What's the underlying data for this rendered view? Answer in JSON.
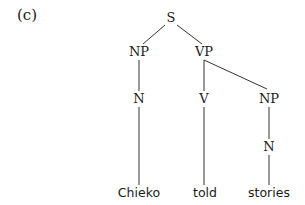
{
  "example_label": "(c)",
  "tree": {
    "nodes": [
      {
        "id": "S",
        "label": "S",
        "x": 171,
        "y": 22
      },
      {
        "id": "NP1",
        "label": "NP",
        "x": 139,
        "y": 56
      },
      {
        "id": "VP",
        "label": "VP",
        "x": 204,
        "y": 56
      },
      {
        "id": "N1",
        "label": "N",
        "x": 139,
        "y": 103
      },
      {
        "id": "V",
        "label": "V",
        "x": 204,
        "y": 103
      },
      {
        "id": "NP2",
        "label": "NP",
        "x": 269,
        "y": 103
      },
      {
        "id": "N2",
        "label": "N",
        "x": 269,
        "y": 151
      }
    ],
    "leaves": [
      {
        "id": "w1",
        "label": "Chieko",
        "x": 139,
        "y": 197
      },
      {
        "id": "w2",
        "label": "told",
        "x": 205,
        "y": 197
      },
      {
        "id": "w3",
        "label": "stories",
        "x": 269,
        "y": 197
      }
    ],
    "edges": [
      {
        "from": "S",
        "to": "NP1",
        "x1": 165,
        "y1": 25,
        "x2": 143,
        "y2": 44
      },
      {
        "from": "S",
        "to": "VP",
        "x1": 177,
        "y1": 25,
        "x2": 202,
        "y2": 44
      },
      {
        "from": "NP1",
        "to": "N1",
        "x1": 139,
        "y1": 60,
        "x2": 139,
        "y2": 91
      },
      {
        "from": "VP",
        "to": "V",
        "x1": 204,
        "y1": 60,
        "x2": 204,
        "y2": 91
      },
      {
        "from": "VP",
        "to": "NP2",
        "x1": 204,
        "y1": 60,
        "x2": 267,
        "y2": 89
      },
      {
        "from": "N1",
        "to": "w1",
        "x1": 139,
        "y1": 107,
        "x2": 139,
        "y2": 185
      },
      {
        "from": "V",
        "to": "w2",
        "x1": 204,
        "y1": 107,
        "x2": 204,
        "y2": 185
      },
      {
        "from": "NP2",
        "to": "N2",
        "x1": 269,
        "y1": 107,
        "x2": 269,
        "y2": 139
      },
      {
        "from": "N2",
        "to": "w3",
        "x1": 269,
        "y1": 155,
        "x2": 269,
        "y2": 185
      }
    ]
  }
}
